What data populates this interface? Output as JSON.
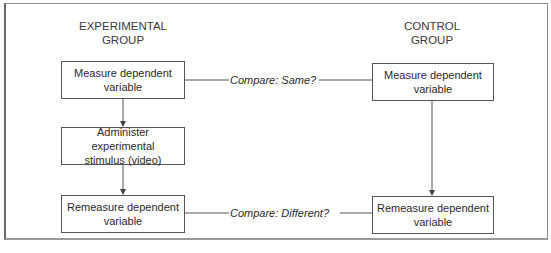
{
  "diagram": {
    "experimental": {
      "heading_line1": "EXPERIMENTAL",
      "heading_line2": "GROUP",
      "steps": [
        {
          "line1": "Measure dependent",
          "line2": "variable"
        },
        {
          "line1": "Administer experimental",
          "line2": "stimulus (video)"
        },
        {
          "line1": "Remeasure dependent",
          "line2": "variable"
        }
      ]
    },
    "control": {
      "heading_line1": "CONTROL",
      "heading_line2": "GROUP",
      "steps": [
        {
          "line1": "Measure dependent",
          "line2": "variable"
        },
        {
          "line1": "Remeasure dependent",
          "line2": "variable"
        }
      ]
    },
    "comparisons": [
      {
        "label": "Compare: Same?"
      },
      {
        "label": "Compare: Different?"
      }
    ],
    "colors": {
      "line": "#555555",
      "frame": "#8a8a8a",
      "text": "#2a2a2a"
    }
  }
}
